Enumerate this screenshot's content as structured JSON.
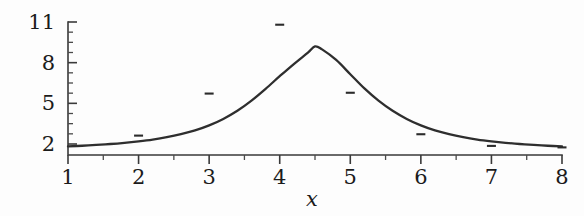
{
  "figure": {
    "background_color": "#fdfdfd",
    "ink_color": "#2e2e2e"
  },
  "chart_data": {
    "type": "line",
    "title": "",
    "subtitle": "",
    "xlabel": "x",
    "ylabel": "",
    "xlim": [
      1,
      8
    ],
    "ylim": [
      1.55,
      11
    ],
    "grid": false,
    "legend": null,
    "x_ticks": [
      1,
      2,
      3,
      4,
      5,
      6,
      7,
      8
    ],
    "x_tick_labels": [
      "1",
      "2",
      "3",
      "4",
      "5",
      "6",
      "7",
      "8"
    ],
    "x_minor_ticks": [
      1.5,
      2.5,
      3.5,
      4.5,
      5.5,
      6.5,
      7.5
    ],
    "y_ticks": [
      2,
      5,
      8,
      11
    ],
    "y_tick_labels": [
      "2",
      "5",
      "8",
      "11"
    ],
    "y_minor_ticks": [
      2.75,
      3.5,
      4.25,
      5.75,
      6.5,
      7.25,
      8.75,
      9.5,
      10.25
    ],
    "series": [
      {
        "name": "fitted-curve",
        "type": "line",
        "color": "#2e2e2e",
        "x": [
          1.0,
          1.2,
          1.4,
          1.6,
          1.8,
          2.0,
          2.2,
          2.4,
          2.6,
          2.8,
          3.0,
          3.2,
          3.4,
          3.6,
          3.8,
          4.0,
          4.2,
          4.4,
          4.5,
          4.6,
          4.8,
          5.0,
          5.2,
          5.4,
          5.6,
          5.8,
          6.0,
          6.2,
          6.4,
          6.6,
          6.8,
          7.0,
          7.2,
          7.4,
          7.6,
          7.8,
          8.0
        ],
        "y": [
          1.82,
          1.87,
          1.93,
          2.0,
          2.09,
          2.2,
          2.33,
          2.5,
          2.72,
          3.0,
          3.37,
          3.85,
          4.45,
          5.2,
          6.07,
          7.0,
          7.9,
          8.74,
          9.2,
          8.98,
          8.2,
          7.15,
          6.1,
          5.2,
          4.45,
          3.85,
          3.37,
          3.0,
          2.72,
          2.5,
          2.33,
          2.2,
          2.09,
          2.0,
          1.93,
          1.87,
          1.82
        ]
      },
      {
        "name": "observed-points",
        "type": "scatter",
        "marker": "horizontal-dash",
        "color": "#2b2b2b",
        "x": [
          2,
          3,
          4,
          5,
          6,
          7,
          8
        ],
        "y": [
          2.62,
          5.72,
          10.8,
          5.78,
          2.72,
          1.86,
          1.75
        ]
      }
    ]
  }
}
